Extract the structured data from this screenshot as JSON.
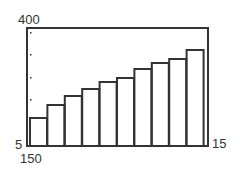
{
  "chart_data": {
    "type": "bar",
    "title": "",
    "xlabel": "",
    "ylabel": "",
    "categories": [
      "1",
      "2",
      "3",
      "4",
      "5",
      "6",
      "7",
      "8",
      "9",
      "10"
    ],
    "values": [
      99,
      142,
      172,
      196,
      219,
      233,
      263,
      283,
      296,
      326
    ],
    "ylim": [
      5,
      400
    ],
    "grid": false,
    "legend": "none",
    "annotations": {
      "top_left": "400",
      "bottom_left": "5",
      "below_left": "150",
      "bottom_right": "15"
    }
  },
  "colors": {
    "stroke": "#333333",
    "background": "#ffffff"
  }
}
